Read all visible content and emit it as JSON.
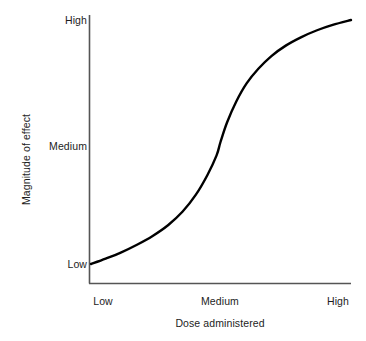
{
  "chart_data": {
    "type": "line",
    "title": "",
    "subtitle": "",
    "xlabel": "Dose administered",
    "ylabel": "Magnitude of effect",
    "grid": false,
    "legend": null,
    "legend_position": "none",
    "line_color": "#000000",
    "axis_color": "#555555",
    "background": "#ffffff",
    "xlim": [
      0,
      1
    ],
    "ylim": [
      0,
      1
    ],
    "xticks": [
      {
        "value": 0.055,
        "label": "Low"
      },
      {
        "value": 0.5,
        "label": "Medium"
      },
      {
        "value": 0.95,
        "label": "High"
      }
    ],
    "yticks": [
      {
        "value": 0.0,
        "label": "Low"
      },
      {
        "value": 0.5,
        "label": "Medium"
      },
      {
        "value": 1.0,
        "label": "High"
      }
    ],
    "series": [
      {
        "name": "dose-response",
        "points": [
          {
            "x": 0.004,
            "y": 0.0
          },
          {
            "x": 0.06,
            "y": 0.022
          },
          {
            "x": 0.12,
            "y": 0.048
          },
          {
            "x": 0.18,
            "y": 0.079
          },
          {
            "x": 0.24,
            "y": 0.115
          },
          {
            "x": 0.3,
            "y": 0.16
          },
          {
            "x": 0.355,
            "y": 0.215
          },
          {
            "x": 0.405,
            "y": 0.283
          },
          {
            "x": 0.45,
            "y": 0.365
          },
          {
            "x": 0.485,
            "y": 0.445
          },
          {
            "x": 0.5,
            "y": 0.5
          },
          {
            "x": 0.525,
            "y": 0.58
          },
          {
            "x": 0.56,
            "y": 0.665
          },
          {
            "x": 0.6,
            "y": 0.74
          },
          {
            "x": 0.645,
            "y": 0.8
          },
          {
            "x": 0.695,
            "y": 0.852
          },
          {
            "x": 0.75,
            "y": 0.895
          },
          {
            "x": 0.81,
            "y": 0.93
          },
          {
            "x": 0.87,
            "y": 0.958
          },
          {
            "x": 0.93,
            "y": 0.98
          },
          {
            "x": 1.0,
            "y": 1.0
          }
        ]
      }
    ],
    "annotations": []
  },
  "axes": {
    "y_title": "Magnitude of effect",
    "x_title": "Dose administered",
    "y_ticks": [
      "High",
      "Medium",
      "Low"
    ],
    "x_ticks": [
      "Low",
      "Medium",
      "High"
    ]
  }
}
